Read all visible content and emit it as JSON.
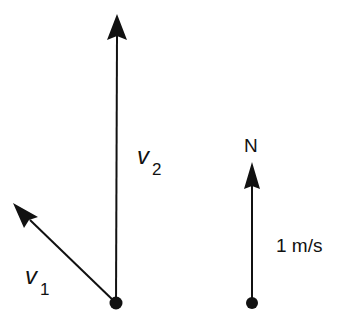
{
  "diagram": {
    "type": "velocity vector diagram",
    "vectors": [
      {
        "id": "v1",
        "label": "v",
        "subscript": "1",
        "direction": "northwest",
        "tail": [
          116,
          303
        ],
        "tip": [
          14,
          204
        ]
      },
      {
        "id": "v2",
        "label": "v",
        "subscript": "2",
        "direction": "north",
        "tail": [
          116,
          303
        ],
        "tip": [
          117,
          15
        ]
      }
    ],
    "scale": {
      "label": "1 m/s",
      "direction_label": "N",
      "tail": [
        252,
        303
      ],
      "tip": [
        252,
        163
      ]
    },
    "colors": {
      "ink": "#111111",
      "background": "#ffffff"
    }
  }
}
